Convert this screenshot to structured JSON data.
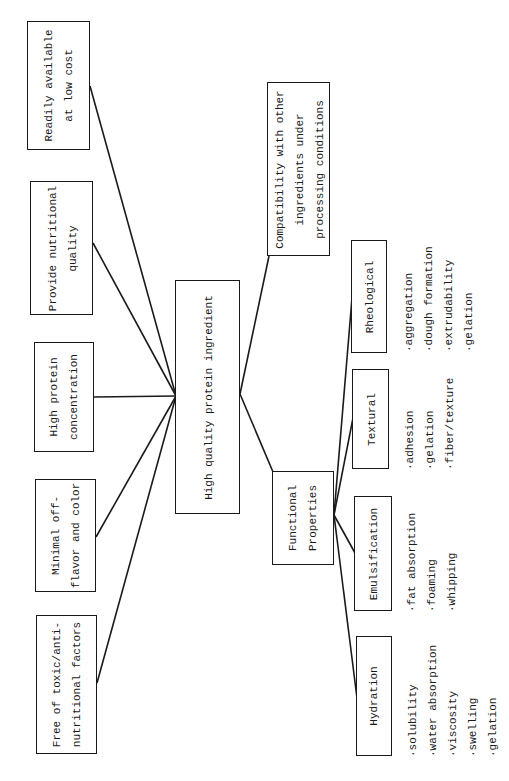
{
  "diagram": {
    "title": "High quality protein ingredient",
    "central_node": {
      "label": "High quality protein ingredient"
    },
    "requirements": [
      {
        "id": "readily",
        "lines": [
          "Readily available",
          "at low cost"
        ]
      },
      {
        "id": "nutritional",
        "lines": [
          "Provide nutritional",
          "quality"
        ]
      },
      {
        "id": "concentration",
        "lines": [
          "High protein",
          "concentration"
        ]
      },
      {
        "id": "offflavor",
        "lines": [
          "Minimal off-",
          "flavor and color"
        ]
      },
      {
        "id": "toxic",
        "lines": [
          "Free of toxic/anti-",
          "nutritional factors"
        ]
      },
      {
        "id": "compatibility",
        "lines": [
          "Compatibility with other",
          "ingredients under",
          "processing conditions"
        ]
      }
    ],
    "functional": {
      "lines": [
        "Functional",
        "Properties"
      ],
      "categories": [
        {
          "id": "rheological",
          "label": "Rheological",
          "items": [
            "·aggregation",
            "·dough formation",
            "·extrudability",
            "·gelation"
          ]
        },
        {
          "id": "textural",
          "label": "Textural",
          "items": [
            "·adhesion",
            "·gelation",
            "·fiber/texture"
          ]
        },
        {
          "id": "emulsification",
          "label": "Emulsification",
          "items": [
            "·fat absorption",
            "·foaming",
            "·whipping"
          ]
        },
        {
          "id": "hydration",
          "label": "Hydration",
          "items": [
            "·solubility",
            "·water absorption",
            "·viscosity",
            "·swelling",
            "·gelation"
          ]
        }
      ]
    },
    "orientation": "rotated 90 degrees counter-clockwise",
    "colors": {
      "ink": "#1a1a1a",
      "paper": "#ffffff"
    }
  }
}
